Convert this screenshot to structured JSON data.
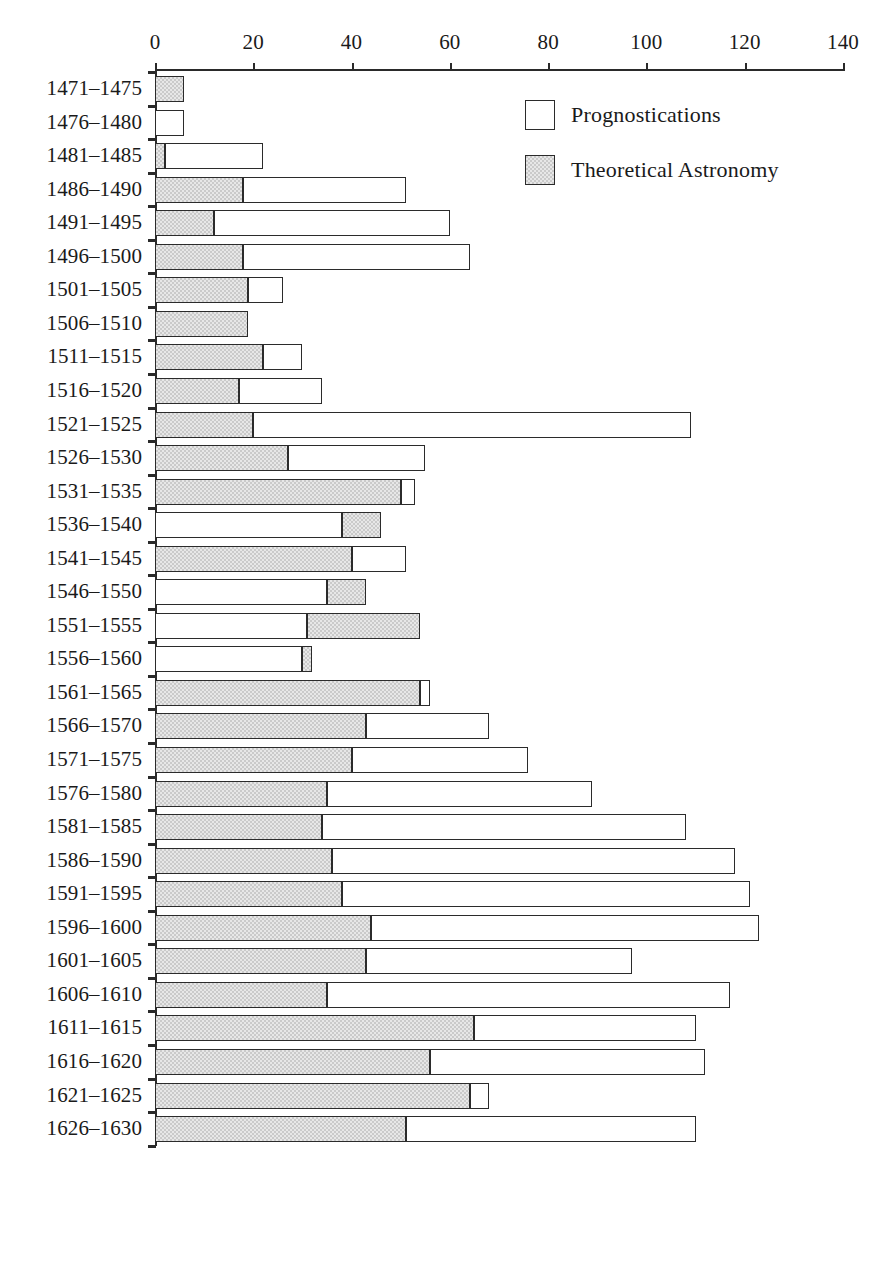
{
  "chart_data": {
    "type": "bar",
    "orientation": "horizontal",
    "stacked": true,
    "title": "",
    "subtitle": "",
    "xlabel": "",
    "ylabel": "",
    "xlim": [
      0,
      140
    ],
    "ylim": null,
    "grid": false,
    "legend_position": "top-right",
    "xticks": [
      0,
      20,
      40,
      60,
      80,
      100,
      120,
      140
    ],
    "xtick_labels": [
      "0",
      "20",
      "40",
      "60",
      "80",
      "100",
      "120",
      "140"
    ],
    "categories": [
      "1471–1475",
      "1476–1480",
      "1481–1485",
      "1486–1490",
      "1491–1495",
      "1496–1500",
      "1501–1505",
      "1506–1510",
      "1511–1515",
      "1516–1520",
      "1521–1525",
      "1526–1530",
      "1531–1535",
      "1536–1540",
      "1541–1545",
      "1546–1550",
      "1551–1555",
      "1556–1560",
      "1561–1565",
      "1566–1570",
      "1571–1575",
      "1576–1580",
      "1581–1585",
      "1586–1590",
      "1591–1595",
      "1596–1600",
      "1601–1605",
      "1606–1610",
      "1611–1615",
      "1616–1620",
      "1621–1625",
      "1626–1630"
    ],
    "series": [
      {
        "name": "Theoretical Astronomy",
        "color": "#cacaca",
        "values": [
          6,
          0,
          2,
          18,
          12,
          18,
          19,
          19,
          22,
          17,
          20,
          27,
          50,
          8,
          40,
          8,
          23,
          2,
          54,
          43,
          40,
          35,
          34,
          36,
          38,
          44,
          43,
          35,
          65,
          56,
          64,
          51
        ]
      },
      {
        "name": "Prognostications",
        "color": "#ffffff",
        "values": [
          0,
          6,
          20,
          33,
          48,
          46,
          7,
          0,
          8,
          17,
          89,
          28,
          3,
          38,
          11,
          35,
          31,
          30,
          1.5,
          25,
          36,
          54,
          74,
          82,
          83,
          79,
          54,
          82,
          45,
          56,
          4,
          59
        ]
      }
    ],
    "bars": [
      {
        "category": "1471–1475",
        "segments": [
          {
            "series": "Theoretical Astronomy",
            "start": 0,
            "end": 6
          }
        ],
        "total": 6
      },
      {
        "category": "1476–1480",
        "segments": [
          {
            "series": "Prognostications",
            "start": 0,
            "end": 6
          }
        ],
        "total": 6
      },
      {
        "category": "1481–1485",
        "segments": [
          {
            "series": "Theoretical Astronomy",
            "start": 0,
            "end": 2
          },
          {
            "series": "Prognostications",
            "start": 2,
            "end": 22
          }
        ],
        "total": 22
      },
      {
        "category": "1486–1490",
        "segments": [
          {
            "series": "Theoretical Astronomy",
            "start": 0,
            "end": 18
          },
          {
            "series": "Prognostications",
            "start": 18,
            "end": 51
          }
        ],
        "total": 51
      },
      {
        "category": "1491–1495",
        "segments": [
          {
            "series": "Theoretical Astronomy",
            "start": 0,
            "end": 12
          },
          {
            "series": "Prognostications",
            "start": 12,
            "end": 60
          }
        ],
        "total": 60
      },
      {
        "category": "1496–1500",
        "segments": [
          {
            "series": "Theoretical Astronomy",
            "start": 0,
            "end": 18
          },
          {
            "series": "Prognostications",
            "start": 18,
            "end": 64
          }
        ],
        "total": 64
      },
      {
        "category": "1501–1505",
        "segments": [
          {
            "series": "Theoretical Astronomy",
            "start": 0,
            "end": 19
          },
          {
            "series": "Prognostications",
            "start": 19,
            "end": 26
          }
        ],
        "total": 26
      },
      {
        "category": "1506–1510",
        "segments": [
          {
            "series": "Theoretical Astronomy",
            "start": 0,
            "end": 19
          }
        ],
        "total": 19
      },
      {
        "category": "1511–1515",
        "segments": [
          {
            "series": "Theoretical Astronomy",
            "start": 0,
            "end": 22
          },
          {
            "series": "Prognostications",
            "start": 22,
            "end": 30
          }
        ],
        "total": 30
      },
      {
        "category": "1516–1520",
        "segments": [
          {
            "series": "Theoretical Astronomy",
            "start": 0,
            "end": 17
          },
          {
            "series": "Prognostications",
            "start": 17,
            "end": 34
          }
        ],
        "total": 34
      },
      {
        "category": "1521–1525",
        "segments": [
          {
            "series": "Theoretical Astronomy",
            "start": 0,
            "end": 20
          },
          {
            "series": "Prognostications",
            "start": 20,
            "end": 109
          }
        ],
        "total": 109
      },
      {
        "category": "1526–1530",
        "segments": [
          {
            "series": "Theoretical Astronomy",
            "start": 0,
            "end": 27
          },
          {
            "series": "Prognostications",
            "start": 27,
            "end": 55
          }
        ],
        "total": 55
      },
      {
        "category": "1531–1535",
        "segments": [
          {
            "series": "Theoretical Astronomy",
            "start": 0,
            "end": 50
          },
          {
            "series": "Prognostications",
            "start": 50,
            "end": 53
          }
        ],
        "total": 53
      },
      {
        "category": "1536–1540",
        "segments": [
          {
            "series": "Prognostications",
            "start": 0,
            "end": 38
          },
          {
            "series": "Theoretical Astronomy",
            "start": 38,
            "end": 46
          }
        ],
        "total": 46
      },
      {
        "category": "1541–1545",
        "segments": [
          {
            "series": "Theoretical Astronomy",
            "start": 0,
            "end": 40
          },
          {
            "series": "Prognostications",
            "start": 40,
            "end": 51
          }
        ],
        "total": 51
      },
      {
        "category": "1546–1550",
        "segments": [
          {
            "series": "Prognostications",
            "start": 0,
            "end": 35
          },
          {
            "series": "Theoretical Astronomy",
            "start": 35,
            "end": 43
          }
        ],
        "total": 43
      },
      {
        "category": "1551–1555",
        "segments": [
          {
            "series": "Prognostications",
            "start": 0,
            "end": 31
          },
          {
            "series": "Theoretical Astronomy",
            "start": 31,
            "end": 54
          }
        ],
        "total": 54
      },
      {
        "category": "1556–1560",
        "segments": [
          {
            "series": "Prognostications",
            "start": 0,
            "end": 30
          },
          {
            "series": "Theoretical Astronomy",
            "start": 30,
            "end": 32
          }
        ],
        "total": 32
      },
      {
        "category": "1561–1565",
        "segments": [
          {
            "series": "Theoretical Astronomy",
            "start": 0,
            "end": 54
          },
          {
            "series": "Prognostications",
            "start": 54,
            "end": 56
          }
        ],
        "total": 56
      },
      {
        "category": "1566–1570",
        "segments": [
          {
            "series": "Theoretical Astronomy",
            "start": 0,
            "end": 43
          },
          {
            "series": "Prognostications",
            "start": 43,
            "end": 68
          }
        ],
        "total": 68
      },
      {
        "category": "1571–1575",
        "segments": [
          {
            "series": "Theoretical Astronomy",
            "start": 0,
            "end": 40
          },
          {
            "series": "Prognostications",
            "start": 40,
            "end": 76
          }
        ],
        "total": 76
      },
      {
        "category": "1576–1580",
        "segments": [
          {
            "series": "Theoretical Astronomy",
            "start": 0,
            "end": 35
          },
          {
            "series": "Prognostications",
            "start": 35,
            "end": 89
          }
        ],
        "total": 89
      },
      {
        "category": "1581–1585",
        "segments": [
          {
            "series": "Theoretical Astronomy",
            "start": 0,
            "end": 34
          },
          {
            "series": "Prognostications",
            "start": 34,
            "end": 108
          }
        ],
        "total": 108
      },
      {
        "category": "1586–1590",
        "segments": [
          {
            "series": "Theoretical Astronomy",
            "start": 0,
            "end": 36
          },
          {
            "series": "Prognostications",
            "start": 36,
            "end": 118
          }
        ],
        "total": 118
      },
      {
        "category": "1591–1595",
        "segments": [
          {
            "series": "Theoretical Astronomy",
            "start": 0,
            "end": 38
          },
          {
            "series": "Prognostications",
            "start": 38,
            "end": 121
          }
        ],
        "total": 121
      },
      {
        "category": "1596–1600",
        "segments": [
          {
            "series": "Theoretical Astronomy",
            "start": 0,
            "end": 44
          },
          {
            "series": "Prognostications",
            "start": 44,
            "end": 123
          }
        ],
        "total": 123
      },
      {
        "category": "1601–1605",
        "segments": [
          {
            "series": "Theoretical Astronomy",
            "start": 0,
            "end": 43
          },
          {
            "series": "Prognostications",
            "start": 43,
            "end": 97
          }
        ],
        "total": 97
      },
      {
        "category": "1606–1610",
        "segments": [
          {
            "series": "Theoretical Astronomy",
            "start": 0,
            "end": 35
          },
          {
            "series": "Prognostications",
            "start": 35,
            "end": 117
          }
        ],
        "total": 117
      },
      {
        "category": "1611–1615",
        "segments": [
          {
            "series": "Theoretical Astronomy",
            "start": 0,
            "end": 65
          },
          {
            "series": "Prognostications",
            "start": 65,
            "end": 110
          }
        ],
        "total": 110
      },
      {
        "category": "1616–1620",
        "segments": [
          {
            "series": "Theoretical Astronomy",
            "start": 0,
            "end": 56
          },
          {
            "series": "Prognostications",
            "start": 56,
            "end": 112
          }
        ],
        "total": 112
      },
      {
        "category": "1621–1625",
        "segments": [
          {
            "series": "Theoretical Astronomy",
            "start": 0,
            "end": 64
          },
          {
            "series": "Prognostications",
            "start": 64,
            "end": 68
          }
        ],
        "total": 68
      },
      {
        "category": "1626–1630",
        "segments": [
          {
            "series": "Theoretical Astronomy",
            "start": 0,
            "end": 51
          },
          {
            "series": "Prognostications",
            "start": 51,
            "end": 110
          }
        ],
        "total": 110
      }
    ],
    "legend": [
      {
        "label": "Prognostications",
        "swatch": "white"
      },
      {
        "label": "Theoretical Astronomy",
        "swatch": "gray"
      }
    ]
  },
  "layout": {
    "plot_left": 155,
    "plot_right": 843,
    "axis_top": 69,
    "row_start_y": 76,
    "row_pitch": 33.55,
    "bar_height": 26,
    "legend_x": 525,
    "legend_y1": 100,
    "legend_y2": 155
  }
}
